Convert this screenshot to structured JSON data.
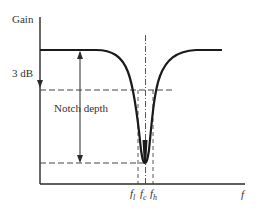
{
  "diagram": {
    "y_axis_label": "Gain",
    "x_axis_label": "f",
    "annotations": {
      "three_db": "3 dB",
      "notch_depth": "Notch depth"
    },
    "frequency_labels": {
      "low": {
        "base": "f",
        "sub": "l"
      },
      "center": {
        "base": "f",
        "sub": "c"
      },
      "high": {
        "base": "f",
        "sub": "h"
      }
    },
    "colors": {
      "curve": "#1a1a1a",
      "axes": "#2a2a2a",
      "dashed": "#444444",
      "text": "#333333"
    }
  }
}
